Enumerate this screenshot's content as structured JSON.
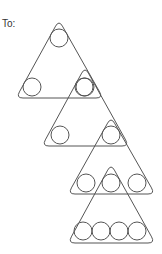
{
  "label": "To:",
  "colors": {
    "stroke": "#555555",
    "text": "#333333"
  },
  "triangles": [
    {
      "apex": [
        59,
        20
      ],
      "left": [
        16,
        98
      ],
      "right": [
        103,
        98
      ],
      "circles": [
        [
          59,
          38
        ],
        [
          32,
          87
        ],
        [
          85,
          87
        ]
      ]
    },
    {
      "apex": [
        85,
        67
      ],
      "left": [
        42,
        146
      ],
      "right": [
        129,
        146
      ],
      "circles": [
        [
          84,
          87
        ],
        [
          60,
          135
        ],
        [
          111,
          135
        ]
      ]
    },
    {
      "apex": [
        111,
        117
      ],
      "left": [
        68,
        194
      ],
      "right": [
        155,
        194
      ],
      "circles": [
        [
          86,
          183
        ],
        [
          111,
          183
        ],
        [
          137,
          183
        ]
      ]
    },
    {
      "apex": [
        111,
        164
      ],
      "left": [
        68,
        243
      ],
      "right": [
        155,
        243
      ],
      "circles": [
        [
          83,
          231
        ],
        [
          101,
          231
        ],
        [
          119,
          231
        ],
        [
          137,
          231
        ]
      ]
    }
  ],
  "circle_radius": 9
}
